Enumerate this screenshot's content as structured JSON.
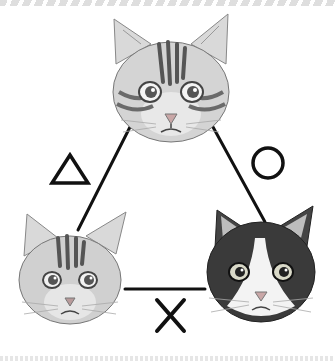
{
  "illustration": {
    "subject": "Cat relationship triangle",
    "cats": [
      {
        "id": "top",
        "pattern": "silver tabby",
        "position": "top-center"
      },
      {
        "id": "bottom-left",
        "pattern": "silver tabby",
        "position": "bottom-left"
      },
      {
        "id": "bottom-right",
        "pattern": "black and white tuxedo",
        "position": "bottom-right"
      }
    ],
    "relations": [
      {
        "between": [
          "top",
          "bottom-left"
        ],
        "symbol": "△",
        "meaning": "so-so"
      },
      {
        "between": [
          "top",
          "bottom-right"
        ],
        "symbol": "○",
        "meaning": "good"
      },
      {
        "between": [
          "bottom-left",
          "bottom-right"
        ],
        "symbol": "✕",
        "meaning": "bad"
      }
    ],
    "colors": {
      "line": "#111111",
      "tabby_fur": "#cfcfcf",
      "tabby_stripe": "#6e6e6e",
      "tuxedo_black": "#3a3a3a",
      "nose": "#c9a7a7",
      "background": "#ffffff"
    }
  }
}
